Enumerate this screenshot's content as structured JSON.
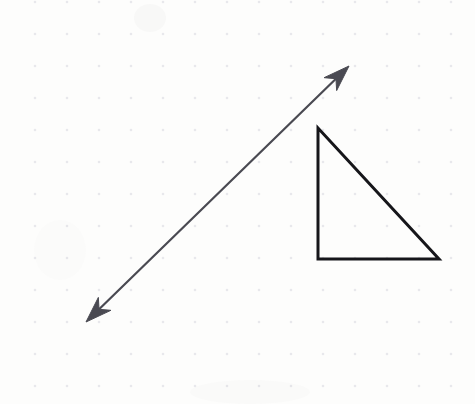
{
  "page": {
    "width": 475,
    "height": 404,
    "background_color": "#fdfdfc",
    "medium": "scanned dotted grid paper"
  },
  "grid": {
    "name": "dot-grid",
    "dot_color": "#e8e8ec",
    "dot_radius": 1.3,
    "spacing_x": 32,
    "spacing_y": 32,
    "origin_x": 35,
    "origin_y": 2,
    "columns": 14,
    "rows": 13,
    "visible": true
  },
  "figures": {
    "arrow": {
      "label": "double-headed-arrow",
      "stroke_color": "#4a4a52",
      "stroke_width": 2.2,
      "start": {
        "x": 86,
        "y": 322
      },
      "end": {
        "x": 349,
        "y": 66
      },
      "heads": "both",
      "head_length": 26,
      "head_half_width": 9,
      "slope_description": "rises left-to-right"
    },
    "triangle": {
      "label": "right-triangle",
      "stroke_color": "#16161a",
      "stroke_width": 3,
      "fill": "none",
      "vertices": [
        {
          "name": "apex-top-left",
          "x": 318,
          "y": 128
        },
        {
          "name": "right-angle-bottom-left",
          "x": 318,
          "y": 259
        },
        {
          "name": "bottom-right",
          "x": 439,
          "y": 259
        }
      ],
      "legs": {
        "vertical_length": 131,
        "horizontal_length": 121
      },
      "right_angle_at": "bottom-left"
    }
  },
  "artifacts": [
    {
      "name": "paper-smudge-top",
      "x": 150,
      "y": 18,
      "rx": 16,
      "ry": 14,
      "opacity": 0.05
    },
    {
      "name": "paper-smudge-left",
      "x": 60,
      "y": 250,
      "rx": 26,
      "ry": 30,
      "opacity": 0.025
    },
    {
      "name": "paper-smudge-bottom",
      "x": 250,
      "y": 392,
      "rx": 60,
      "ry": 12,
      "opacity": 0.03
    }
  ],
  "colors": {
    "ink_dark": "#16161a",
    "ink_gray": "#4a4a52",
    "dot": "#e8e8ec",
    "paper": "#fdfdfc"
  }
}
